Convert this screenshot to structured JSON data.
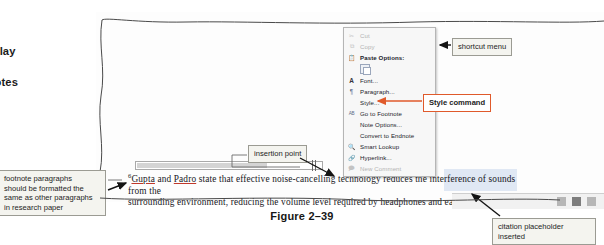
{
  "instruction": {
    "text": "click the\next in the\note to display\ntcut menu\nd to footnotes\ne 2–39)."
  },
  "document": {
    "line1_a": "Gupta",
    "line1_b": " and ",
    "line1_c": "Padro",
    "line1_d": " state that effective noise-cancelling technology reduces the interference of sounds from the",
    "line2": "surrounding environment, reducing the volume level required by headphones and earbuds (Gupta).",
    "footnote_marker": "6",
    "pilcrow": "¶"
  },
  "shortcut_menu": {
    "items": [
      {
        "label": "Cut",
        "icon": "scissors-icon",
        "disabled": true,
        "bold": false
      },
      {
        "label": "Copy",
        "icon": "copy-icon",
        "disabled": true,
        "bold": false
      },
      {
        "label": "Paste Options:",
        "icon": "paste-icon",
        "disabled": false,
        "bold": true
      },
      {
        "label": "Font...",
        "icon": "font-icon",
        "disabled": false,
        "bold": false
      },
      {
        "label": "Paragraph...",
        "icon": "paragraph-icon",
        "disabled": false,
        "bold": false
      },
      {
        "label": "Style...",
        "icon": "none",
        "disabled": false,
        "bold": false
      },
      {
        "label": "Go to Footnote",
        "icon": "abc-icon",
        "disabled": false,
        "bold": false
      },
      {
        "label": "Note Options...",
        "icon": "none",
        "disabled": false,
        "bold": false
      },
      {
        "label": "Convert to Endnote",
        "icon": "none",
        "disabled": false,
        "bold": false
      },
      {
        "label": "Smart Lookup",
        "icon": "lookup-icon",
        "disabled": false,
        "bold": false
      },
      {
        "label": "Hyperlink...",
        "icon": "link-icon",
        "disabled": false,
        "bold": false
      },
      {
        "label": "New Comment",
        "icon": "comment-icon",
        "disabled": true,
        "bold": false
      }
    ]
  },
  "callouts": {
    "shortcut_menu": "shortcut menu",
    "style_command": "Style command",
    "insertion_point": "insertion point",
    "footnote_paragraphs": "footnote paragraphs\nshould be formatted the\nsame as other paragraphs\nin research paper",
    "citation_placeholder": "citation placeholder\ninserted"
  },
  "figure": {
    "caption": "Figure 2–39"
  },
  "colors": {
    "accent": "#e05a2b",
    "callout_bg": "#f4f4ef",
    "callout_border": "#9b9b93",
    "menu_bg": "#f7f7f7",
    "highlight": "#a0b9e1"
  }
}
